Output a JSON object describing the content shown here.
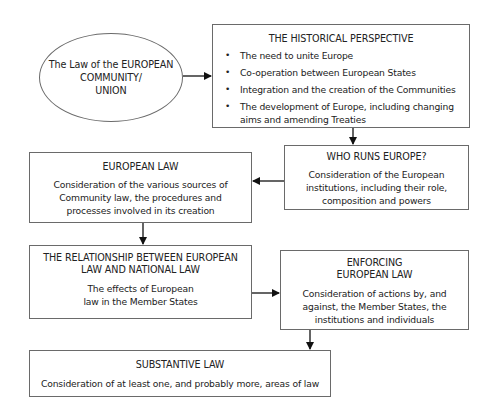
{
  "start": {
    "text_line1": "The Law of the EUROPEAN",
    "text_line2": "COMMUNITY/",
    "text_line3": "UNION"
  },
  "historical": {
    "title": "THE HISTORICAL PERSPECTIVE",
    "bullets": [
      "The need to unite Europe",
      "Co-operation between European States",
      "Integration and the creation of the Communities",
      "The development of Europe, including changing aims and amending Treaties"
    ],
    "bullet_glyph": "•"
  },
  "who_runs": {
    "title": "WHO RUNS EUROPE?",
    "body": "Consideration of the European institutions, including their role, composition and powers"
  },
  "european_law": {
    "title": "EUROPEAN LAW",
    "body": "Consideration of the various sources of Community law, the procedures and processes involved in its creation"
  },
  "relationship": {
    "title": "THE RELATIONSHIP BETWEEN EUROPEAN LAW AND NATIONAL LAW",
    "body": "The effects of European law in the Member States"
  },
  "enforcing": {
    "title_line1": "ENFORCING",
    "title_line2": "EUROPEAN LAW",
    "body": "Consideration of actions by, and against, the Member States, the institutions and individuals"
  },
  "substantive": {
    "title": "SUBSTANTIVE LAW",
    "body": "Consideration of at least one, and probably more, areas of law"
  },
  "colors": {
    "line": "#6a6a6a",
    "arrow": "#111111",
    "text": "#222222"
  }
}
